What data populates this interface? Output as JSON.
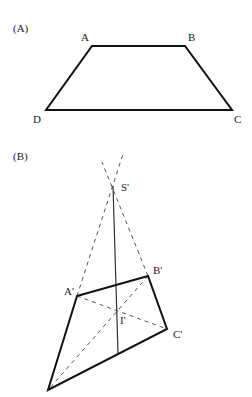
{
  "panel_a": {
    "label": "(A)",
    "vertices": {
      "A": {
        "label": "A"
      },
      "B": {
        "label": "B"
      },
      "C": {
        "label": "C"
      },
      "D": {
        "label": "D"
      }
    }
  },
  "panel_b": {
    "label": "(B)",
    "vertices": {
      "A": {
        "label": "A'"
      },
      "B": {
        "label": "B'"
      },
      "C": {
        "label": "C'"
      },
      "S": {
        "label": "S'"
      },
      "I": {
        "label": "I'"
      }
    }
  },
  "colors": {
    "stroke": "#111111",
    "dashed": "#555555",
    "label": "#222222"
  }
}
